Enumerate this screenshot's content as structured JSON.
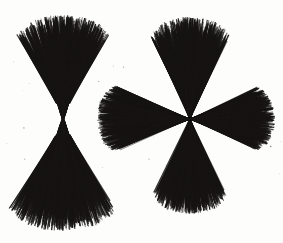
{
  "image": {
    "title": "Iron filing brush figures",
    "description": "Two engraved brush-discharge / iron-filing figures on a plain light ground",
    "width": 283,
    "height": 243,
    "background_color": "#fdfdfb",
    "ink_color": "#161412",
    "caption": "",
    "has_text": false
  },
  "figures": [
    {
      "id": "figure-left",
      "name": "two-lobed-hourglass-brush",
      "label": "Left figure",
      "lobe_count": 2,
      "center": {
        "x": 63,
        "y": 119
      },
      "waist": {
        "type": "narrow-neck",
        "half_width": 2.6,
        "height": 30
      },
      "bounds": {
        "x": 10,
        "y": 16,
        "width": 106,
        "height": 214
      },
      "lobes": [
        {
          "name": "lobe-up",
          "angle_deg": -90,
          "length": 104,
          "spread_deg": 31,
          "tip_width": 100
        },
        {
          "name": "lobe-down",
          "angle_deg": 90,
          "length": 112,
          "spread_deg": 33,
          "tip_width": 106
        }
      ],
      "filament_count": 2100,
      "accent": "#161412"
    },
    {
      "id": "figure-right",
      "name": "four-lobed-cross-brush",
      "label": "Right figure",
      "lobe_count": 4,
      "center": {
        "x": 190,
        "y": 119
      },
      "waist": {
        "type": "point",
        "half_width": 0.8,
        "height": 4
      },
      "bounds": {
        "x": 96,
        "y": 16,
        "width": 180,
        "height": 198
      },
      "lobes": [
        {
          "name": "lobe-up",
          "angle_deg": -90,
          "length": 102,
          "spread_deg": 28,
          "tip_width": 96
        },
        {
          "name": "lobe-down",
          "angle_deg": 90,
          "length": 95,
          "spread_deg": 28,
          "tip_width": 94
        },
        {
          "name": "lobe-left",
          "angle_deg": 180,
          "length": 93,
          "spread_deg": 26,
          "tip_width": 88
        },
        {
          "name": "lobe-right",
          "angle_deg": 0,
          "length": 85,
          "spread_deg": 27,
          "tip_width": 86
        }
      ],
      "filament_count": 3600,
      "accent": "#161412"
    }
  ],
  "chart_data": {
    "type": "scatter",
    "xlabel": "",
    "ylabel": "",
    "xlim": [
      0,
      283
    ],
    "ylim": [
      0,
      243
    ],
    "grid": false,
    "legend": "none",
    "series": [
      {
        "name": "two-lobed-hourglass-brush",
        "center_x": 63,
        "center_y": 119,
        "lobes": 2,
        "lobe_angles_deg": [
          -90,
          90
        ],
        "lobe_lengths": [
          104,
          112
        ],
        "lobe_spreads_deg": [
          31,
          33
        ],
        "waist_half_width": 2.6,
        "filaments": 2100
      },
      {
        "name": "four-lobed-cross-brush",
        "center_x": 190,
        "center_y": 119,
        "lobes": 4,
        "lobe_angles_deg": [
          -90,
          90,
          180,
          0
        ],
        "lobe_lengths": [
          102,
          95,
          93,
          85
        ],
        "lobe_spreads_deg": [
          28,
          28,
          26,
          27
        ],
        "waist_half_width": 0.8,
        "filaments": 3600
      }
    ]
  }
}
